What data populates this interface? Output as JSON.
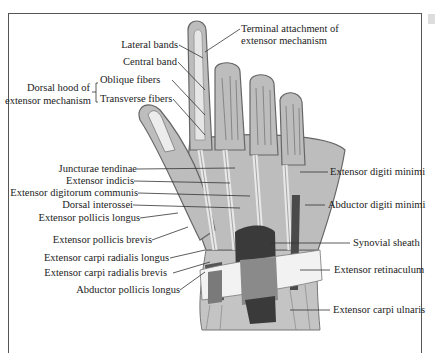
{
  "figure": {
    "labels_left": [
      {
        "id": "lateral_bands",
        "text": "Lateral bands"
      },
      {
        "id": "central_band",
        "text": "Central band"
      },
      {
        "id": "oblique_fibers",
        "text": "Oblique fibers"
      },
      {
        "id": "transverse_fibers",
        "text": "Transverse fibers"
      },
      {
        "id": "dorsal_hood_1",
        "text": "Dorsal hood of"
      },
      {
        "id": "dorsal_hood_2",
        "text": "extensor mechanism"
      },
      {
        "id": "juncturae",
        "text": "Juncturae tendinae"
      },
      {
        "id": "ext_indicis",
        "text": "Extensor indicis"
      },
      {
        "id": "ext_dig_comm",
        "text": "Extensor digitorum communis"
      },
      {
        "id": "dorsal_interossei",
        "text": "Dorsal interossei"
      },
      {
        "id": "epl",
        "text": "Extensor pollicis longus"
      },
      {
        "id": "epb",
        "text": "Extensor pollicis brevis"
      },
      {
        "id": "ecrl",
        "text": "Extensor carpi radialis longus"
      },
      {
        "id": "ecrb",
        "text": "Extensor carpi radialis brevis"
      },
      {
        "id": "apl",
        "text": "Abductor pollicis longus"
      }
    ],
    "labels_right": [
      {
        "id": "terminal_1",
        "text": "Terminal attachment of"
      },
      {
        "id": "terminal_2",
        "text": "extensor mechanism"
      },
      {
        "id": "edm",
        "text": "Extensor digiti minimi"
      },
      {
        "id": "adm",
        "text": "Abductor digiti minimi"
      },
      {
        "id": "synovial",
        "text": "Synovial sheath"
      },
      {
        "id": "retinaculum",
        "text": "Extensor retinaculum"
      },
      {
        "id": "ecu",
        "text": "Extensor carpi ulnaris"
      }
    ],
    "colors": {
      "skin": "#bdbdbd",
      "outline": "#666",
      "tendon": "#e4e4e4",
      "dark": "#3a3a3a",
      "mid": "#8a8a8a",
      "line": "#333"
    }
  }
}
